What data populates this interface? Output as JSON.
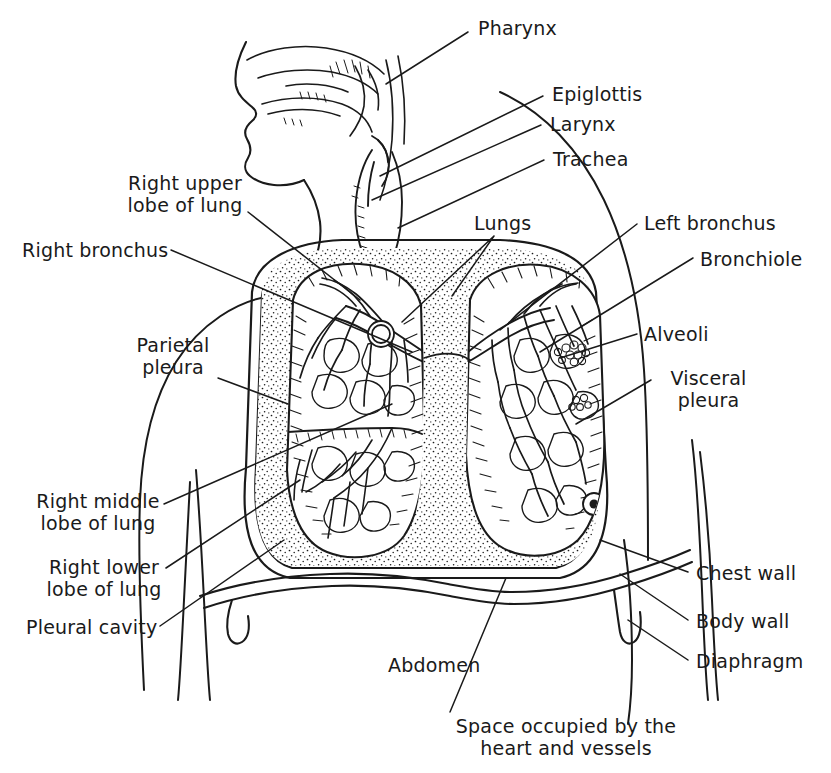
{
  "figure": {
    "style": "black-and-white line drawing",
    "background_color": "#ffffff",
    "ink_color": "#1a1a1a"
  },
  "labels": [
    {
      "id": "pharynx",
      "text": "Pharynx",
      "align": "left"
    },
    {
      "id": "epiglottis",
      "text": "Epiglottis",
      "align": "left"
    },
    {
      "id": "larynx",
      "text": "Larynx",
      "align": "left"
    },
    {
      "id": "trachea",
      "text": "Trachea",
      "align": "left"
    },
    {
      "id": "right-upper-lobe",
      "text": "Right upper\nlobe of lung",
      "align": "center"
    },
    {
      "id": "right-bronchus",
      "text": "Right bronchus",
      "align": "left"
    },
    {
      "id": "lungs",
      "text": "Lungs",
      "align": "left"
    },
    {
      "id": "left-bronchus",
      "text": "Left bronchus",
      "align": "left"
    },
    {
      "id": "bronchiole",
      "text": "Bronchiole",
      "align": "left"
    },
    {
      "id": "parietal-pleura",
      "text": "Parietal\npleura",
      "align": "center"
    },
    {
      "id": "alveoli",
      "text": "Alveoli",
      "align": "left"
    },
    {
      "id": "visceral-pleura",
      "text": "Visceral\npleura",
      "align": "center"
    },
    {
      "id": "right-middle-lobe",
      "text": "Right middle\nlobe of lung",
      "align": "center"
    },
    {
      "id": "right-lower-lobe",
      "text": "Right lower\nlobe of lung",
      "align": "center"
    },
    {
      "id": "pleural-cavity",
      "text": "Pleural cavity",
      "align": "left"
    },
    {
      "id": "chest-wall",
      "text": "Chest wall",
      "align": "left"
    },
    {
      "id": "body-wall",
      "text": "Body wall",
      "align": "left"
    },
    {
      "id": "diaphragm",
      "text": "Diaphragm",
      "align": "left"
    },
    {
      "id": "abdomen",
      "text": "Abdomen",
      "align": "left"
    },
    {
      "id": "heart-space",
      "text": "Space occupied by the\nheart and vessels",
      "align": "center"
    }
  ]
}
